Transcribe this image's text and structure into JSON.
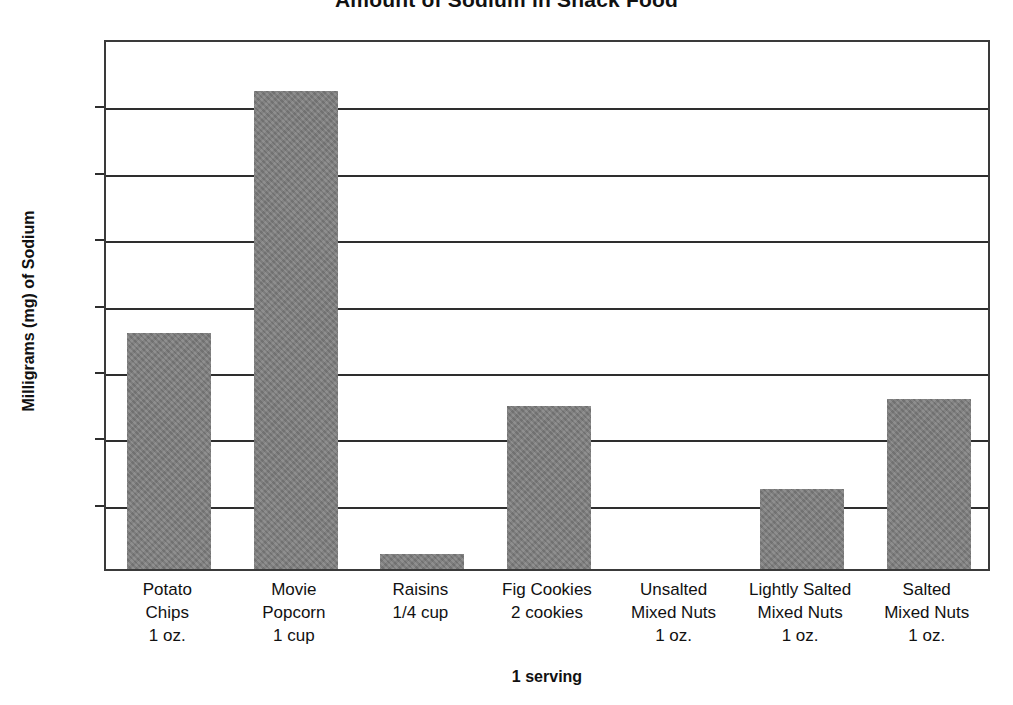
{
  "chart_data": {
    "type": "bar",
    "title": "Amount of Sodium in Snack Food",
    "xlabel": "1 serving",
    "ylabel": "Milligrams (mg) of Sodium",
    "ylim": [
      0,
      400
    ],
    "ytick_step": 50,
    "yticks": [
      "400",
      "350",
      "300",
      "250",
      "200",
      "150",
      "100",
      "50",
      "0"
    ],
    "grid": true,
    "legend": "none",
    "bar_color": "#808080",
    "axis_color": "#2e2e2e",
    "categories": [
      "Potato Chips 1 oz.",
      "Movie Popcorn 1 cup",
      "Raisins 1/4 cup",
      "Fig Cookies 2 cookies",
      "Unsalted Mixed Nuts 1 oz.",
      "Lightly Salted Mixed Nuts 1 oz.",
      "Salted Mixed Nuts 1 oz."
    ],
    "values": [
      178,
      360,
      11,
      123,
      0,
      60,
      128
    ],
    "category_label_lines": [
      [
        "Potato",
        "Chips",
        "1 oz."
      ],
      [
        "Movie",
        "Popcorn",
        "1 cup"
      ],
      [
        "Raisins",
        "1/4 cup"
      ],
      [
        "Fig Cookies",
        "2 cookies"
      ],
      [
        "Unsalted",
        "Mixed Nuts",
        "1 oz."
      ],
      [
        "Lightly Salted",
        "Mixed Nuts",
        "1 oz."
      ],
      [
        "Salted",
        "Mixed Nuts",
        "1 oz."
      ]
    ]
  }
}
